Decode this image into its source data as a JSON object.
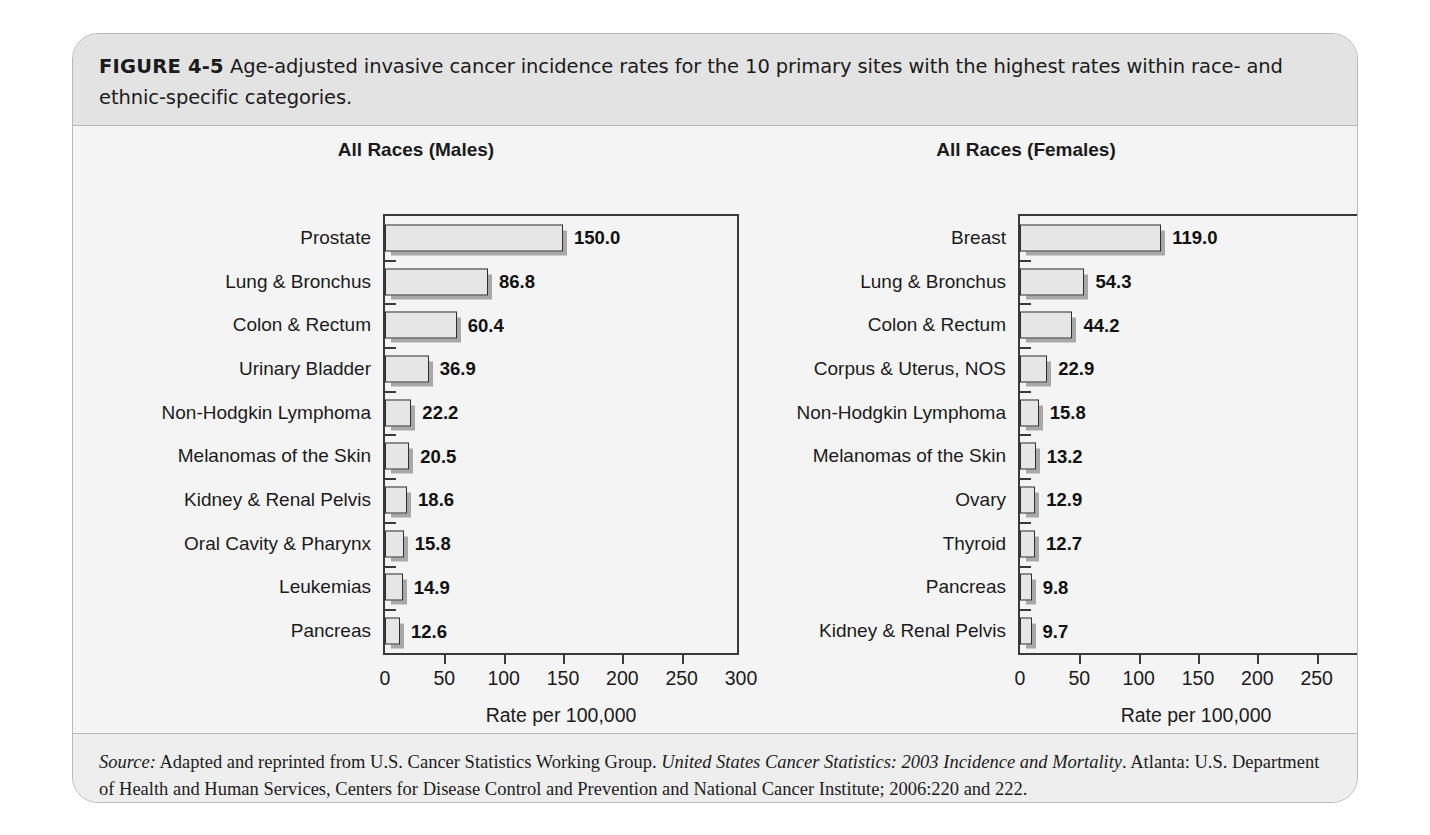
{
  "figure": {
    "label": "FIGURE 4-5",
    "caption": "Age-adjusted invasive cancer incidence rates for the 10 primary sites with the highest rates within race- and ethnic-specific categories.",
    "source_prefix": "Source:",
    "source_part1": " Adapted and reprinted from U.S. Cancer Statistics Working Group. ",
    "source_italic": "United States Cancer Statistics: 2003 Incidence and Mortality",
    "source_part2": ". Atlanta: U.S. Department of Health and Human Services, Centers for Disease Control and Prevention and National Cancer Institute; 2006:220 and 222."
  },
  "chart_data": [
    {
      "type": "bar",
      "orientation": "horizontal",
      "title": "All Races (Males)",
      "xlabel": "Rate per 100,000",
      "ylabel": "",
      "xlim": [
        0,
        300
      ],
      "xticks": [
        0,
        50,
        100,
        150,
        200,
        250,
        300
      ],
      "xtick_labels": [
        "0",
        "50",
        "100",
        "150",
        "200",
        "250",
        "300"
      ],
      "grid": false,
      "legend": "none",
      "categories": [
        "Prostate",
        "Lung & Bronchus",
        "Colon & Rectum",
        "Urinary Bladder",
        "Non-Hodgkin Lymphoma",
        "Melanomas of the Skin",
        "Kidney & Renal Pelvis",
        "Oral Cavity & Pharynx",
        "Leukemias",
        "Pancreas"
      ],
      "values": [
        150.0,
        86.8,
        60.4,
        36.9,
        22.2,
        20.5,
        18.6,
        15.8,
        14.9,
        12.6
      ],
      "value_labels": [
        "150.0",
        "86.8",
        "60.4",
        "36.9",
        "22.2",
        "20.5",
        "18.6",
        "15.8",
        "14.9",
        "12.6"
      ]
    },
    {
      "type": "bar",
      "orientation": "horizontal",
      "title": "All Races (Females)",
      "xlabel": "Rate per 100,000",
      "ylabel": "",
      "xlim": [
        0,
        300
      ],
      "xticks": [
        0,
        50,
        100,
        150,
        200,
        250,
        300
      ],
      "xtick_labels": [
        "0",
        "50",
        "100",
        "150",
        "200",
        "250",
        "300"
      ],
      "grid": false,
      "legend": "none",
      "categories": [
        "Breast",
        "Lung & Bronchus",
        "Colon & Rectum",
        "Corpus & Uterus, NOS",
        "Non-Hodgkin Lymphoma",
        "Melanomas of the Skin",
        "Ovary",
        "Thyroid",
        "Pancreas",
        "Kidney & Renal Pelvis"
      ],
      "values": [
        119.0,
        54.3,
        44.2,
        22.9,
        15.8,
        13.2,
        12.9,
        12.7,
        9.8,
        9.7
      ],
      "value_labels": [
        "119.0",
        "54.3",
        "44.2",
        "22.9",
        "15.8",
        "13.2",
        "12.9",
        "12.7",
        "9.8",
        "9.7"
      ]
    }
  ],
  "style": {
    "panel_bg": "#f4f4f4",
    "caption_bg": "#e3e3e3",
    "bar_fill": "#e6e6e6",
    "bar_border": "#2e2e2e",
    "bar_shadow": "#a8a8a8",
    "axis_color": "#3a3a3a",
    "text_color": "#1b1b1b"
  }
}
